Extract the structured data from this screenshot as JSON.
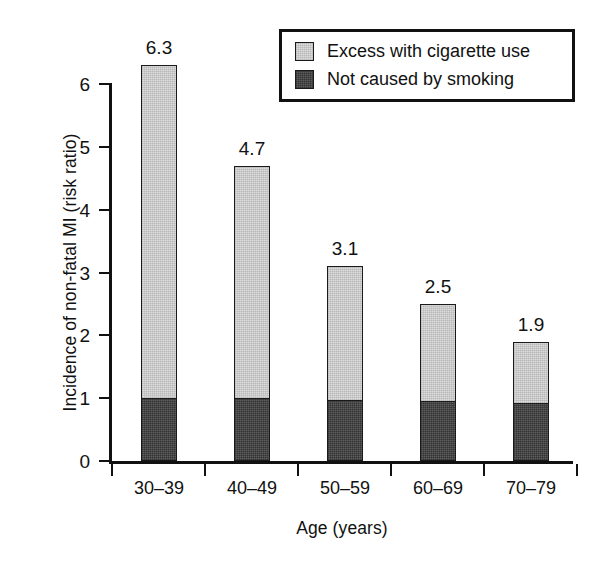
{
  "chart_data": {
    "type": "bar",
    "subtype": "stacked-bar",
    "title": "",
    "xlabel": "Age (years)",
    "ylabel": "Incidence of non-fatal MI (risk ratio)",
    "categories": [
      "30–39",
      "40–49",
      "50–59",
      "60–69",
      "70–79"
    ],
    "totals": [
      6.3,
      4.7,
      3.1,
      2.5,
      1.9
    ],
    "total_labels": [
      "6.3",
      "4.7",
      "3.1",
      "2.5",
      "1.9"
    ],
    "series": [
      {
        "name": "Not caused by smoking",
        "color": "#5e5e5e",
        "values": [
          1.0,
          1.0,
          0.97,
          0.96,
          0.93
        ]
      },
      {
        "name": "Excess with cigarette use",
        "color": "#dcdcdc",
        "values": [
          5.3,
          3.7,
          2.13,
          1.54,
          0.97
        ]
      }
    ],
    "ylim": [
      0,
      6.4
    ],
    "yticks": [
      "0",
      "1",
      "2",
      "3",
      "4",
      "5",
      "6"
    ],
    "ytick_values": [
      0,
      1,
      2,
      3,
      4,
      5,
      6
    ],
    "grid": false,
    "legend_position": "top-right",
    "legend_entries": [
      {
        "label": "Excess with cigarette use",
        "color": "#dcdcdc"
      },
      {
        "label": "Not caused by smoking",
        "color": "#5e5e5e"
      }
    ]
  }
}
